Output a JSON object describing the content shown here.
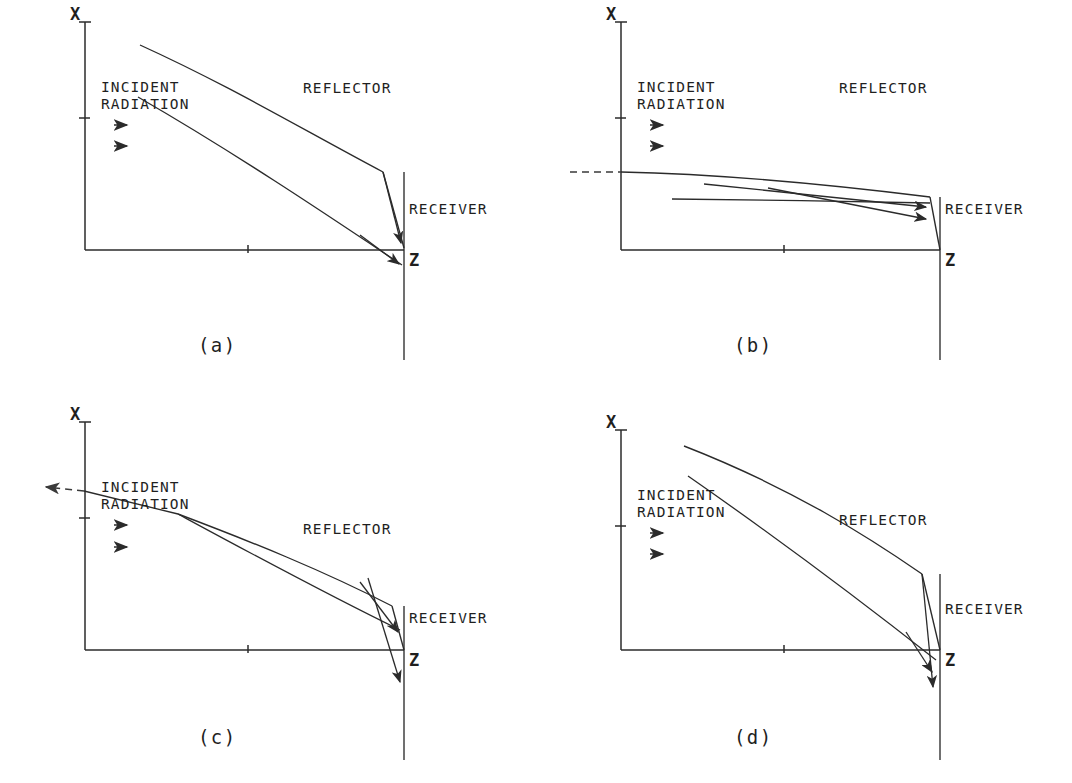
{
  "figure": {
    "background_color": "#ffffff",
    "ink_color": "#2b2b2b",
    "panel_count": 4
  },
  "labels": {
    "x_axis": "X",
    "z_axis": "Z",
    "incident_line1": "INCIDENT",
    "incident_line2": "RADIATION",
    "reflector": "REFLECTOR",
    "receiver": "RECEIVER",
    "arrow_glyph": "→"
  },
  "panels": [
    {
      "id": "a",
      "caption": "(a)",
      "description": "Straight-sloped reflector; rays converge past the receiver and overshoot below the Z axis.",
      "axes": {
        "x_axis_top": 22,
        "x_axis_bottom": 250,
        "x_axis_left": 85,
        "z_axis_right": 404,
        "x_ticks": [
          22,
          118
        ],
        "z_ticks": [
          248
        ]
      },
      "reflector_path": "M 140 45 C 230 86 300 128 383 172",
      "lower_ray_path": "M 138 97 C 230 150 320 210 402 265",
      "receiver": {
        "top_x": 383,
        "top_y": 172,
        "bottom_x": 404,
        "bottom_y": 248
      },
      "receiver_post": {
        "x": 404,
        "y_top": 172,
        "y_bottom": 360
      },
      "arrows": [
        {
          "from": [
            383,
            172
          ],
          "to": [
            402,
            246
          ],
          "kind": "reflected-ray"
        },
        {
          "from": [
            330,
            218
          ],
          "to": [
            400,
            268
          ],
          "kind": "transmitted-ray"
        }
      ],
      "text_positions": {
        "x_label": [
          76,
          20
        ],
        "z_label": [
          409,
          264
        ],
        "incident": [
          101,
          87
        ],
        "radiation": [
          101,
          104
        ],
        "reflector": [
          303,
          88
        ],
        "receiver": [
          409,
          209
        ],
        "caption": [
          205,
          345
        ]
      },
      "feed_arrows": [
        [
          122,
          125
        ],
        [
          122,
          146
        ]
      ]
    },
    {
      "id": "b",
      "caption": "(b)",
      "description": "Nearly flat grazing-incidence reflector; two shallow rays sweep right into the receiver face.",
      "axes": {
        "x_axis_top": 22,
        "x_axis_bottom": 250,
        "x_axis_left": 85,
        "z_axis_right": 404,
        "x_ticks": [
          22,
          118
        ],
        "z_ticks": [
          248
        ]
      },
      "reflector_path": "M 85 172 C 180 174 280 183 394 196",
      "lower_ray_path": "M 136 199 C 220 200 310 201 394 203",
      "receiver": {
        "top_x": 394,
        "top_y": 196,
        "bottom_x": 404,
        "bottom_y": 248
      },
      "receiver_post": {
        "x": 404,
        "y_top": 196,
        "y_bottom": 360
      },
      "dashed_extension": {
        "x1": 36,
        "y1": 172,
        "x2": 85,
        "y2": 172
      },
      "arrows": [
        {
          "from": [
            168,
            184
          ],
          "to": [
            392,
            206
          ],
          "kind": "ray-1"
        },
        {
          "from": [
            232,
            188
          ],
          "to": [
            392,
            218
          ],
          "kind": "ray-2"
        }
      ],
      "text_positions": {
        "x_label": [
          76,
          20
        ],
        "z_label": [
          409,
          264
        ],
        "incident": [
          101,
          87
        ],
        "radiation": [
          101,
          104
        ],
        "reflector": [
          303,
          88
        ],
        "receiver": [
          409,
          209
        ],
        "caption": [
          205,
          345
        ]
      },
      "feed_arrows": [
        [
          122,
          125
        ],
        [
          122,
          146
        ]
      ]
    },
    {
      "id": "c",
      "caption": "(c)",
      "description": "Reflector begins mid-aperture; a dashed ray escapes to the left and two reflected rays cross before the receiver.",
      "axes": {
        "x_axis_top": 22,
        "x_axis_bottom": 250,
        "x_axis_left": 85,
        "z_axis_right": 404,
        "x_ticks": [
          22,
          118
        ],
        "z_ticks": [
          248
        ]
      },
      "reflector_path": "M 175 124 C 250 150 320 175 392 212",
      "lower_ray_path": "M 175 124 C 250 160 320 195 398 230",
      "receiver": {
        "top_x": 392,
        "top_y": 212,
        "bottom_x": 404,
        "bottom_y": 248
      },
      "receiver_post": {
        "x": 404,
        "y_top": 212,
        "y_bottom": 360
      },
      "dashed_escape": {
        "x1": 84,
        "y1": 100,
        "x2": 42,
        "y2": 96,
        "arrow": true
      },
      "escape_solid": {
        "x1": 175,
        "y1": 122,
        "x2": 84,
        "y2": 100
      },
      "arrows": [
        {
          "from": [
            362,
            190
          ],
          "to": [
            400,
            240
          ],
          "kind": "reflected-down"
        },
        {
          "from": [
            333,
            180
          ],
          "to": [
            403,
            290
          ],
          "kind": "reflected-steep"
        }
      ],
      "text_positions": {
        "x_label": [
          76,
          20
        ],
        "z_label": [
          409,
          264
        ],
        "incident": [
          101,
          88
        ],
        "radiation": [
          101,
          105
        ],
        "reflector": [
          303,
          108
        ],
        "receiver": [
          409,
          225
        ],
        "caption": [
          205,
          345
        ]
      },
      "feed_arrows": [
        [
          122,
          128
        ],
        [
          122,
          150
        ]
      ]
    },
    {
      "id": "d",
      "caption": "(d)",
      "description": "Deeply curved reflector; rays converge onto a long receiver and exit steeply below the Z axis.",
      "axes": {
        "x_axis_top": 22,
        "x_axis_bottom": 250,
        "x_axis_left": 85,
        "z_axis_right": 404,
        "x_ticks": [
          22,
          118
        ],
        "z_ticks": [
          248
        ]
      },
      "reflector_path": "M 145 48 C 250 90 330 140 385 178",
      "lower_ray_path": "M 148 78 C 240 140 330 210 398 262",
      "receiver": {
        "top_x": 385,
        "top_y": 178,
        "bottom_x": 404,
        "bottom_y": 254
      },
      "receiver_post": {
        "x": 404,
        "y_top": 178,
        "y_bottom": 360
      },
      "arrows": [
        {
          "from": [
            385,
            178
          ],
          "to": [
            399,
            288
          ],
          "kind": "reflected-ray"
        },
        {
          "from": [
            340,
            215
          ],
          "to": [
            400,
            300
          ],
          "kind": "transmitted-ray"
        }
      ],
      "text_positions": {
        "x_label": [
          76,
          20
        ],
        "z_label": [
          409,
          264
        ],
        "incident": [
          101,
          94
        ],
        "radiation": [
          101,
          111
        ],
        "reflector": [
          303,
          100
        ],
        "receiver": [
          409,
          216
        ],
        "caption": [
          205,
          345
        ]
      },
      "feed_arrows": [
        [
          122,
          132
        ],
        [
          122,
          153
        ]
      ]
    }
  ]
}
